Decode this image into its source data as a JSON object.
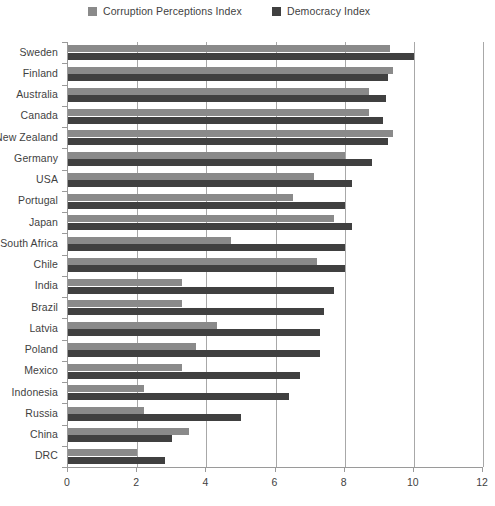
{
  "chart_data": {
    "type": "bar",
    "orientation": "horizontal",
    "title": "",
    "subtitle": "",
    "xlabel": "",
    "ylabel": "",
    "xlim": [
      0,
      12
    ],
    "xticks": [
      0,
      2,
      4,
      6,
      8,
      10,
      12
    ],
    "xtick_labels": [
      "0",
      "2",
      "4",
      "6",
      "8",
      "10",
      "12"
    ],
    "grid": true,
    "grid_axis": "x",
    "legend_position": "top",
    "categories": [
      "Sweden",
      "Finland",
      "Australia",
      "Canada",
      "New Zealand",
      "Germany",
      "USA",
      "Portugal",
      "Japan",
      "South Africa",
      "Chile",
      "India",
      "Brazil",
      "Latvia",
      "Poland",
      "Mexico",
      "Indonesia",
      "Russia",
      "China",
      "DRC"
    ],
    "series": [
      {
        "name": "Corruption Perceptions Index",
        "color": "#8a8a8a",
        "values": [
          9.3,
          9.4,
          8.7,
          8.7,
          9.4,
          8.0,
          7.1,
          6.5,
          7.7,
          4.7,
          7.2,
          3.3,
          3.3,
          4.3,
          3.7,
          3.3,
          2.2,
          2.2,
          3.5,
          2.0
        ]
      },
      {
        "name": "Democracy Index",
        "color": "#404040",
        "values": [
          10.0,
          9.25,
          9.2,
          9.1,
          9.25,
          8.8,
          8.2,
          8.0,
          8.2,
          8.0,
          8.0,
          7.7,
          7.4,
          7.3,
          7.3,
          6.7,
          6.4,
          5.0,
          3.0,
          2.8
        ]
      }
    ]
  }
}
